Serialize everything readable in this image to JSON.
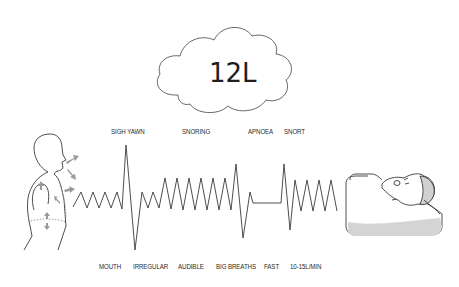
{
  "cloud": {
    "label": "12L"
  },
  "top_labels": [
    {
      "text": "SIGH YAWN",
      "x": 111,
      "y": 127
    },
    {
      "text": "SNORING",
      "x": 182,
      "y": 127
    },
    {
      "text": "APNOEA",
      "x": 248,
      "y": 127
    },
    {
      "text": "SNORT",
      "x": 284,
      "y": 127
    }
  ],
  "bottom_labels": [
    {
      "text": "MOUTH",
      "x": 99,
      "y": 262
    },
    {
      "text": "IRREGULAR",
      "x": 133,
      "y": 262
    },
    {
      "text": "AUDIBLE",
      "x": 178,
      "y": 262
    },
    {
      "text": "BIG BREATHS",
      "x": 216,
      "y": 262
    },
    {
      "text": "FAST",
      "x": 264,
      "y": 262
    },
    {
      "text": "10-15L/MIN",
      "x": 290,
      "y": 262
    }
  ],
  "figures": {
    "left": "upright-person-breathing-icon",
    "right": "person-sleeping-in-bed-icon"
  },
  "colors": {
    "line": "#3a3a3a",
    "arrow": "#9a9a9a",
    "pillow_shade": "#d4d4d4"
  }
}
